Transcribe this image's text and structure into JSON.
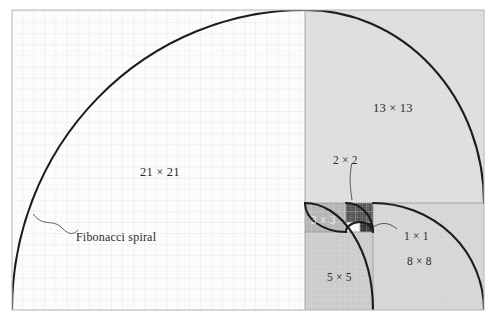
{
  "figure": {
    "title": "Fibonacci spiral",
    "caption_label": "Fibonacci spiral",
    "background_color": "#ffffff",
    "frame_color": "#b9b9b9",
    "spiral_color": "#1a1a1a",
    "grid_minor_color": "#ededed",
    "grid_major_color": "#e0e0e0",
    "leader_color": "#3a3a3a"
  },
  "squares": [
    {
      "id": "sq-21",
      "label": "21 × 21",
      "size": 21,
      "fill": "#ffffff",
      "label_x": 140,
      "label_y": 166
    },
    {
      "id": "sq-13",
      "label": "13 × 13",
      "size": 13,
      "fill": "#dadada",
      "label_x": 373,
      "label_y": 102
    },
    {
      "id": "sq-8",
      "label": "8 × 8",
      "size": 8,
      "fill": "#d0d0d0",
      "label_x": 407,
      "label_y": 256
    },
    {
      "id": "sq-5",
      "label": "5 × 5",
      "size": 5,
      "fill": "#c4c4c4",
      "label_x": 327,
      "label_y": 272
    },
    {
      "id": "sq-3",
      "label": "3 × 3",
      "size": 3,
      "fill": "#a8a8a8",
      "label_x": 311,
      "label_y": 215
    },
    {
      "id": "sq-2",
      "label": "2 × 2",
      "size": 2,
      "fill": "#3a3a3a",
      "label_x": 333,
      "label_y": 155
    },
    {
      "id": "sq-1a",
      "label": "1 × 1",
      "size": 1,
      "fill": "#ffffff",
      "label_x": 404,
      "label_y": 231
    },
    {
      "id": "sq-1b",
      "label": "",
      "size": 1,
      "fill": "#111111",
      "label_x": 0,
      "label_y": 0
    }
  ],
  "sequence": [
    1,
    1,
    2,
    3,
    5,
    8,
    13,
    21
  ]
}
